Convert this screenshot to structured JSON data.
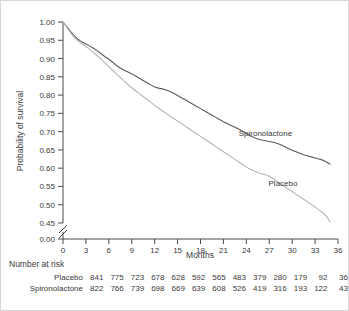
{
  "chart_data": {
    "type": "line",
    "title": "",
    "xlabel": "Months",
    "ylabel": "Probability of survival",
    "xlim": [
      0,
      36
    ],
    "ylim": [
      0.45,
      1.0
    ],
    "y_axis_break": true,
    "y_break_value": "0.00",
    "grid": false,
    "legend_position": "inline-annotation",
    "xticks": [
      "0",
      "3",
      "6",
      "9",
      "12",
      "15",
      "18",
      "21",
      "24",
      "27",
      "30",
      "33",
      "36"
    ],
    "yticks": [
      "1.00",
      "0.95",
      "0.90",
      "0.85",
      "0.80",
      "0.75",
      "0.70",
      "0.65",
      "0.60",
      "0.55",
      "0.50",
      "0.45",
      "0.00"
    ],
    "series": [
      {
        "name": "Spironolactone",
        "color": "#5a5a5a",
        "label_x": 26.5,
        "label_y": 0.688,
        "x": [
          0,
          0.5,
          1,
          1.5,
          2,
          2.5,
          3,
          3.5,
          4,
          4.5,
          5,
          5.5,
          6,
          6.5,
          7,
          7.5,
          8,
          8.5,
          9,
          9.5,
          10,
          10.5,
          11,
          11.5,
          12,
          12.5,
          13,
          13.5,
          14,
          14.5,
          15,
          15.5,
          16,
          16.5,
          17,
          17.5,
          18,
          18.5,
          19,
          19.5,
          20,
          20.5,
          21,
          21.5,
          22,
          22.5,
          23,
          23.5,
          24,
          24.5,
          25,
          25.5,
          26,
          26.5,
          27,
          27.5,
          28,
          28.5,
          29,
          29.5,
          30,
          30.5,
          31,
          31.5,
          32,
          32.5,
          33,
          33.5,
          34,
          34.5,
          35
        ],
        "y": [
          1.0,
          0.987,
          0.974,
          0.962,
          0.952,
          0.945,
          0.94,
          0.934,
          0.928,
          0.921,
          0.913,
          0.905,
          0.898,
          0.89,
          0.881,
          0.874,
          0.868,
          0.863,
          0.858,
          0.852,
          0.846,
          0.84,
          0.834,
          0.828,
          0.822,
          0.819,
          0.817,
          0.814,
          0.81,
          0.805,
          0.799,
          0.793,
          0.787,
          0.781,
          0.775,
          0.769,
          0.763,
          0.757,
          0.751,
          0.745,
          0.739,
          0.733,
          0.727,
          0.722,
          0.717,
          0.712,
          0.707,
          0.701,
          0.695,
          0.689,
          0.684,
          0.68,
          0.677,
          0.675,
          0.673,
          0.671,
          0.668,
          0.664,
          0.659,
          0.654,
          0.649,
          0.645,
          0.641,
          0.637,
          0.634,
          0.631,
          0.628,
          0.625,
          0.622,
          0.617,
          0.61
        ]
      },
      {
        "name": "Placebo",
        "color": "#b5b5b5",
        "label_x": 28.8,
        "label_y": 0.552,
        "x": [
          0,
          0.5,
          1,
          1.5,
          2,
          2.5,
          3,
          3.5,
          4,
          4.5,
          5,
          5.5,
          6,
          6.5,
          7,
          7.5,
          8,
          8.5,
          9,
          9.5,
          10,
          10.5,
          11,
          11.5,
          12,
          12.5,
          13,
          13.5,
          14,
          14.5,
          15,
          15.5,
          16,
          16.5,
          17,
          17.5,
          18,
          18.5,
          19,
          19.5,
          20,
          20.5,
          21,
          21.5,
          22,
          22.5,
          23,
          23.5,
          24,
          24.5,
          25,
          25.5,
          26,
          26.5,
          27,
          27.5,
          28,
          28.5,
          29,
          29.5,
          30,
          30.5,
          31,
          31.5,
          32,
          32.5,
          33,
          33.5,
          34,
          34.5,
          35
        ],
        "y": [
          1.0,
          0.985,
          0.97,
          0.957,
          0.947,
          0.94,
          0.933,
          0.925,
          0.916,
          0.907,
          0.898,
          0.888,
          0.878,
          0.868,
          0.858,
          0.848,
          0.838,
          0.829,
          0.82,
          0.812,
          0.804,
          0.796,
          0.788,
          0.78,
          0.772,
          0.764,
          0.757,
          0.75,
          0.743,
          0.736,
          0.729,
          0.722,
          0.715,
          0.708,
          0.701,
          0.694,
          0.687,
          0.68,
          0.673,
          0.666,
          0.659,
          0.652,
          0.645,
          0.638,
          0.631,
          0.624,
          0.617,
          0.61,
          0.603,
          0.597,
          0.592,
          0.588,
          0.585,
          0.582,
          0.578,
          0.571,
          0.564,
          0.557,
          0.55,
          0.543,
          0.536,
          0.529,
          0.522,
          0.515,
          0.508,
          0.501,
          0.494,
          0.486,
          0.478,
          0.468,
          0.452
        ]
      }
    ]
  },
  "risk_table": {
    "title": "Number at risk",
    "rows": [
      {
        "label": "Placebo",
        "values": [
          "841",
          "775",
          "723",
          "678",
          "628",
          "592",
          "565",
          "483",
          "379",
          "280",
          "179",
          "92",
          "36"
        ]
      },
      {
        "label": "Spironolactone",
        "values": [
          "822",
          "766",
          "739",
          "698",
          "669",
          "639",
          "608",
          "526",
          "419",
          "316",
          "193",
          "122",
          "43"
        ]
      }
    ]
  }
}
